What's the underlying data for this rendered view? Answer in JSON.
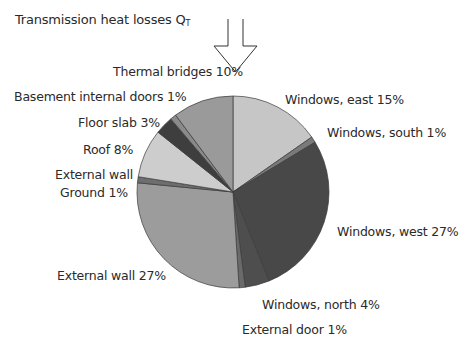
{
  "chart_data": {
    "type": "pie",
    "title": "Transmission heat losses Q",
    "title_subscript": "T",
    "start_angle_deg": 0,
    "direction": "clockwise",
    "categories": [
      "Windows, east",
      "Windows, south",
      "Windows, west",
      "Windows, north",
      "External door",
      "External wall",
      "External wall Ground",
      "Roof",
      "Floor slab",
      "Basement internal doors",
      "Thermal bridges"
    ],
    "values": [
      15,
      1,
      27,
      4,
      1,
      27,
      1,
      8,
      3,
      1,
      10
    ],
    "unit": "%",
    "colors": [
      "#c6c6c6",
      "#7a7a7a",
      "#484848",
      "#4e4e4e",
      "#6a6a6a",
      "#9c9c9c",
      "#6e6e6e",
      "#cdcdcd",
      "#3e3e3e",
      "#8a8a8a",
      "#9a9a9a"
    ],
    "legend": "none (direct labels)"
  },
  "labels": {
    "title": "Transmission heat losses Q",
    "title_sub": "T",
    "thermal_bridges": "Thermal bridges 10%",
    "basement_doors": "Basement internal doors 1%",
    "floor_slab": "Floor slab 3%",
    "roof": "Roof 8%",
    "ext_wall_ground_1": "External wall",
    "ext_wall_ground_2": "Ground 1%",
    "ext_wall": "External wall 27%",
    "win_east": "Windows, east 15%",
    "win_south": "Windows, south 1%",
    "win_west": "Windows, west 27%",
    "win_north": "Windows, north 4%",
    "ext_door": "External door 1%"
  }
}
